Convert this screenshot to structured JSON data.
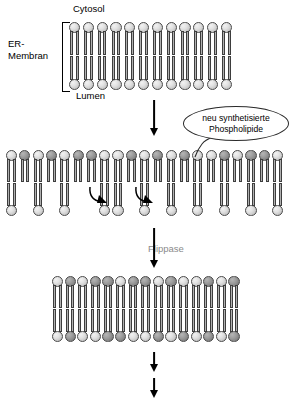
{
  "figure": {
    "labels": {
      "cytosol": "Cytosol",
      "lumen": "Lumen",
      "er_membrane_line1": "ER-",
      "er_membrane_line2": "Membran",
      "flippase": "Flippase"
    },
    "callout": {
      "line1": "neu synthetisierte",
      "line2": "Phospholipide"
    }
  },
  "colors": {
    "head_light": "#e2e2e2",
    "head_dark": "#9d9d9d",
    "tail": "#8d8d8d",
    "outline": "#4a4a4a",
    "arrow": "#000000",
    "flippase_text": "#8a8a8a"
  },
  "membranes": [
    {
      "name": "er-membrane-initial",
      "x": 69,
      "y": 22,
      "width": 166,
      "height": 68,
      "lipid_count": 12,
      "spacing": 13.8,
      "upper_heads": [
        "light",
        "light",
        "light",
        "light",
        "light",
        "light",
        "light",
        "light",
        "light",
        "light",
        "light",
        "light"
      ],
      "lower_heads": [
        "light",
        "light",
        "light",
        "light",
        "light",
        "light",
        "light",
        "light",
        "light",
        "light",
        "light",
        "light"
      ],
      "lower_present": [
        true,
        true,
        true,
        true,
        true,
        true,
        true,
        true,
        true,
        true,
        true,
        true
      ]
    },
    {
      "name": "er-membrane-asymmetric",
      "x": 6,
      "y": 150,
      "width": 281,
      "height": 66,
      "lipid_count": 21,
      "spacing": 13.3,
      "upper_heads": [
        "light",
        "dark",
        "light",
        "dark",
        "light",
        "dark",
        "dark",
        "light",
        "light",
        "dark",
        "light",
        "dark",
        "light",
        "dark",
        "light",
        "light",
        "dark",
        "light",
        "dark",
        "dark",
        "light"
      ],
      "lower_heads": [
        "light",
        "light",
        "light",
        "light",
        "light",
        "light",
        "light",
        "light",
        "light",
        "light"
      ],
      "lower_present": [
        true,
        false,
        true,
        false,
        true,
        false,
        false,
        true,
        true,
        false,
        true,
        false,
        true,
        false,
        true,
        false,
        true,
        false,
        true,
        false,
        true
      ]
    },
    {
      "name": "er-membrane-symmetric",
      "x": 52,
      "y": 276,
      "width": 188,
      "height": 66,
      "lipid_count": 15,
      "spacing": 12.6,
      "upper_heads": [
        "light",
        "dark",
        "light",
        "dark",
        "dark",
        "light",
        "dark",
        "dark",
        "light",
        "dark",
        "light",
        "light",
        "dark",
        "light",
        "dark"
      ],
      "lower_heads": [
        "light",
        "dark",
        "light",
        "light",
        "dark",
        "dark",
        "light",
        "light",
        "dark",
        "light",
        "dark",
        "light",
        "dark",
        "light",
        "dark"
      ],
      "lower_present": [
        true,
        true,
        true,
        true,
        true,
        true,
        true,
        true,
        true,
        true,
        true,
        true,
        true,
        true,
        true
      ]
    }
  ],
  "arrows": [
    {
      "name": "arrow-synthesis",
      "x": 148,
      "y": 100,
      "length": 36
    },
    {
      "name": "arrow-flippase",
      "x": 148,
      "y": 228,
      "length": 40
    },
    {
      "name": "arrow-transport-1",
      "x": 148,
      "y": 352,
      "length": 20
    },
    {
      "name": "arrow-transport-2",
      "x": 148,
      "y": 378,
      "length": 20
    }
  ],
  "flip_arrows": [
    {
      "name": "flip-arrow-left",
      "x": 88,
      "y": 184
    },
    {
      "name": "flip-arrow-right",
      "x": 134,
      "y": 184
    }
  ]
}
